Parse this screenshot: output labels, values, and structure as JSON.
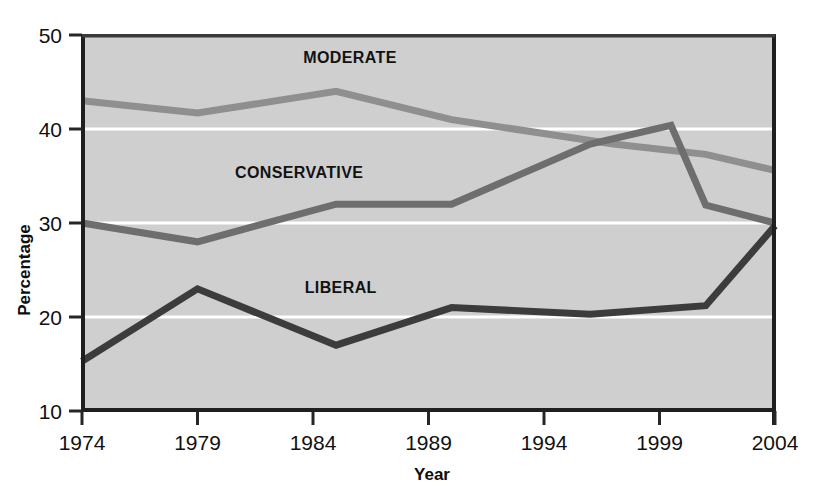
{
  "chart_data": {
    "type": "line",
    "title": "",
    "xlabel": "Year",
    "ylabel": "Percentage",
    "xlim": [
      1974,
      2004
    ],
    "ylim": [
      10,
      50
    ],
    "xticks": [
      1974,
      1979,
      1984,
      1989,
      1994,
      1999,
      2004
    ],
    "yticks": [
      10,
      20,
      30,
      40,
      50
    ],
    "grid": "horizontal-white-gridlines",
    "legend": "inline-labels-on-plot",
    "plot_background": "#cfcfcf",
    "series": [
      {
        "name": "MODERATE",
        "color": "#8f8f8f",
        "label_x": 1985.6,
        "label_y": 47.0,
        "x": [
          1974,
          1979,
          1985,
          1990,
          1997,
          2001,
          2004
        ],
        "values": [
          43.0,
          41.7,
          44.0,
          41.0,
          38.4,
          37.3,
          35.6
        ]
      },
      {
        "name": "CONSERVATIVE",
        "color": "#6e6e6e",
        "label_x": 1983.4,
        "label_y": 34.8,
        "x": [
          1974,
          1979,
          1985,
          1990,
          1996,
          1999.5,
          2001,
          2004
        ],
        "values": [
          30.0,
          28.0,
          32.0,
          32.0,
          38.4,
          40.4,
          31.9,
          30.0
        ]
      },
      {
        "name": "LIBERAL",
        "color": "#3c3c3c",
        "label_x": 1985.2,
        "label_y": 22.6,
        "x": [
          1974,
          1979,
          1985,
          1990,
          1996,
          2001,
          2004
        ],
        "values": [
          15.3,
          23.0,
          17.0,
          21.0,
          20.3,
          21.2,
          29.7
        ]
      }
    ]
  },
  "axes": {
    "x_title": "Year",
    "y_title": "Percentage",
    "x_tick_labels": [
      "1974",
      "1979",
      "1984",
      "1989",
      "1994",
      "1999",
      "2004"
    ],
    "y_tick_labels": [
      "10",
      "20",
      "30",
      "40",
      "50"
    ]
  },
  "colors": {
    "plot_bg": "#cfcfcf",
    "page_bg": "#ffffff",
    "axis": "#262626",
    "gridline": "#ffffff",
    "moderate": "#8f8f8f",
    "conservative": "#6e6e6e",
    "liberal": "#3c3c3c",
    "text": "#111111"
  }
}
